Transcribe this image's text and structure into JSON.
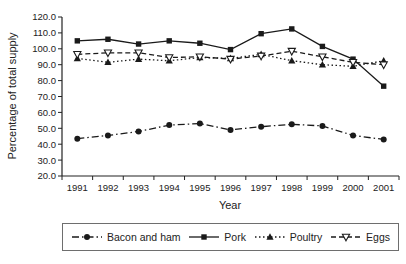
{
  "chart_data": {
    "type": "line",
    "title": "",
    "xlabel": "Year",
    "ylabel": "Percentage of total supply",
    "x": [
      1991,
      1992,
      1993,
      1994,
      1995,
      1996,
      1997,
      1998,
      1999,
      2000,
      2001
    ],
    "ylim": [
      20,
      120
    ],
    "ytick_step": 10,
    "ytick_labels": [
      "120.0",
      "110.0",
      "100.0",
      "90.0",
      "80.0",
      "70.0",
      "60.0",
      "50.0",
      "40.0",
      "30.0",
      "20.0"
    ],
    "grid": false,
    "legend_position": "bottom",
    "axis_color": "#222222",
    "series": [
      {
        "name": "Bacon and ham",
        "marker": "filled-circle",
        "line_style": "dash-dot",
        "color": "#1a1a1a",
        "values": [
          43.5,
          45.5,
          48.0,
          52.0,
          53.0,
          49.0,
          51.0,
          52.5,
          51.5,
          45.5,
          43.0
        ]
      },
      {
        "name": "Pork",
        "marker": "filled-square",
        "line_style": "solid",
        "color": "#1a1a1a",
        "values": [
          105.0,
          106.0,
          103.0,
          105.0,
          103.5,
          99.5,
          109.5,
          112.5,
          101.5,
          93.5,
          76.5
        ]
      },
      {
        "name": "Poultry",
        "marker": "filled-triangle-up",
        "line_style": "dotted",
        "color": "#1a1a1a",
        "values": [
          94.0,
          91.5,
          93.5,
          92.5,
          94.5,
          94.0,
          96.5,
          92.5,
          90.0,
          89.0,
          92.5
        ]
      },
      {
        "name": "Eggs",
        "marker": "open-triangle-down",
        "line_style": "dashed",
        "color": "#1a1a1a",
        "values": [
          96.5,
          97.5,
          97.5,
          94.5,
          95.0,
          93.5,
          95.5,
          98.5,
          95.0,
          91.5,
          90.0
        ]
      }
    ]
  }
}
